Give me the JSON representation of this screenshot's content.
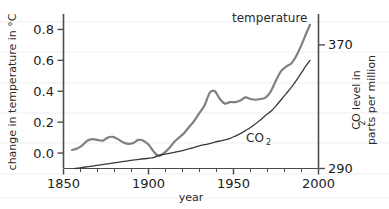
{
  "chart_data": {
    "type": "line",
    "title": "",
    "xlabel": "year",
    "ylabel_left": "change in temperature in °C",
    "ylabel_right_line1": "CO  level in",
    "ylabel_right_line2": "parts per million",
    "ylabel_right_sub": "2",
    "xlim": [
      1850,
      2000
    ],
    "xticks": [
      1850,
      1900,
      1950,
      2000
    ],
    "xticklabels": [
      "1850",
      "1900",
      "1950",
      "2000"
    ],
    "x_minor_tick_step": 10,
    "ylim_left": [
      -0.1,
      0.9
    ],
    "yticks_left": [
      0.0,
      0.2,
      0.4,
      0.6,
      0.8
    ],
    "yticklabels_left": [
      "0.0",
      "0.2",
      "0.4",
      "0.6",
      "0.8"
    ],
    "ylim_right": [
      290,
      390
    ],
    "yticks_right": [
      290,
      370
    ],
    "yticklabels_right": [
      "290",
      "370"
    ],
    "grid": false,
    "legend_position": "inline-annotation",
    "series": [
      {
        "name": "temperature",
        "label": "temperature",
        "color": "#808080",
        "linewidth": 2.2,
        "axis": "left",
        "annotation_x": 1962,
        "annotation_y": 0.88,
        "x": [
          1855,
          1858,
          1861,
          1864,
          1867,
          1870,
          1873,
          1876,
          1879,
          1882,
          1885,
          1888,
          1891,
          1894,
          1897,
          1900,
          1903,
          1906,
          1909,
          1912,
          1915,
          1918,
          1921,
          1924,
          1927,
          1930,
          1933,
          1936,
          1939,
          1942,
          1945,
          1948,
          1951,
          1954,
          1957,
          1960,
          1963,
          1966,
          1969,
          1972,
          1975,
          1978,
          1981,
          1984,
          1987,
          1990,
          1993,
          1995
        ],
        "y": [
          0.02,
          0.03,
          0.05,
          0.08,
          0.09,
          0.085,
          0.08,
          0.1,
          0.105,
          0.09,
          0.07,
          0.06,
          0.065,
          0.085,
          0.08,
          0.055,
          0.01,
          -0.02,
          0.0,
          0.03,
          0.07,
          0.1,
          0.13,
          0.17,
          0.21,
          0.26,
          0.31,
          0.39,
          0.4,
          0.35,
          0.32,
          0.33,
          0.33,
          0.34,
          0.36,
          0.35,
          0.345,
          0.35,
          0.36,
          0.4,
          0.47,
          0.53,
          0.56,
          0.58,
          0.63,
          0.7,
          0.78,
          0.83
        ]
      },
      {
        "name": "co2",
        "label": "CO",
        "label_sub": "2",
        "color": "#3a3a3a",
        "linewidth": 1.3,
        "axis": "right",
        "annotation_x": 1958,
        "annotation_y_left_units": 0.045,
        "x": [
          1857,
          1862,
          1867,
          1872,
          1877,
          1882,
          1887,
          1892,
          1897,
          1900,
          1903,
          1906,
          1909,
          1912,
          1915,
          1918,
          1921,
          1924,
          1927,
          1930,
          1933,
          1936,
          1939,
          1942,
          1945,
          1948,
          1951,
          1954,
          1957,
          1960,
          1963,
          1966,
          1969,
          1972,
          1975,
          1978,
          1981,
          1984,
          1987,
          1990,
          1993,
          1995
        ],
        "y_ppm": [
          290.0,
          290.8,
          291.6,
          292.4,
          293.2,
          294.0,
          294.8,
          295.6,
          296.3,
          296.6,
          297.0,
          298.6,
          299.2,
          299.8,
          300.4,
          301.1,
          301.9,
          302.8,
          303.7,
          304.7,
          305.4,
          306.1,
          307.0,
          307.8,
          308.5,
          309.5,
          311.0,
          312.6,
          314.5,
          316.5,
          319.0,
          321.5,
          324.5,
          327.0,
          330.5,
          334.5,
          338.5,
          342.5,
          347.0,
          352.0,
          357.0,
          360.0
        ]
      }
    ]
  },
  "axes": {
    "left_axis_name": "temperature-axis",
    "right_axis_name": "co2-axis",
    "bottom_axis_name": "year-axis"
  }
}
